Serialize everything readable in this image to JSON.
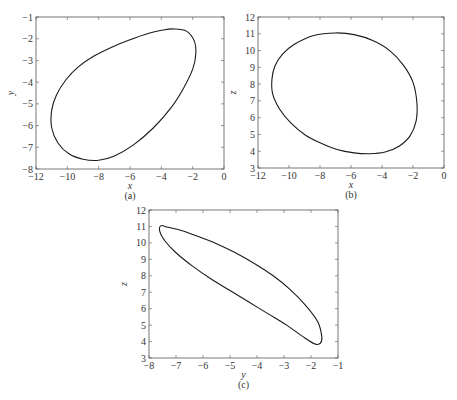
{
  "chart_data": [
    {
      "id": "a",
      "type": "line",
      "caption": "(a)",
      "xlabel": "x",
      "ylabel": "y",
      "xlim": [
        -12,
        0
      ],
      "ylim": [
        -8,
        -1
      ],
      "xticks": [
        -12,
        -10,
        -8,
        -6,
        -4,
        -2,
        0
      ],
      "yticks": [
        -8,
        -7,
        -6,
        -5,
        -4,
        -3,
        -2,
        -1
      ],
      "grid": false,
      "series": [
        {
          "name": "trajectory x-y",
          "closed": true,
          "x": [
            -3.2,
            -2.4,
            -1.9,
            -1.8,
            -2.0,
            -2.6,
            -3.4,
            -4.5,
            -5.8,
            -7.0,
            -8.0,
            -9.0,
            -9.9,
            -10.6,
            -11.0,
            -11.0,
            -10.7,
            -10.1,
            -9.3,
            -8.3,
            -7.2,
            -6.0,
            -4.8,
            -3.9
          ],
          "y": [
            -1.55,
            -1.65,
            -2.1,
            -2.7,
            -3.4,
            -4.3,
            -5.2,
            -6.1,
            -6.9,
            -7.4,
            -7.6,
            -7.55,
            -7.3,
            -6.8,
            -6.1,
            -5.3,
            -4.6,
            -3.9,
            -3.3,
            -2.8,
            -2.4,
            -2.05,
            -1.75,
            -1.6
          ]
        }
      ]
    },
    {
      "id": "b",
      "type": "line",
      "caption": "(b)",
      "xlabel": "x",
      "ylabel": "z",
      "xlim": [
        -12,
        0
      ],
      "ylim": [
        3,
        12
      ],
      "xticks": [
        -12,
        -10,
        -8,
        -6,
        -4,
        -2,
        0
      ],
      "yticks": [
        3,
        4,
        5,
        6,
        7,
        8,
        9,
        10,
        11,
        12
      ],
      "grid": false,
      "series": [
        {
          "name": "trajectory x-z",
          "closed": true,
          "x": [
            -7.0,
            -5.8,
            -4.6,
            -3.5,
            -2.6,
            -2.0,
            -1.75,
            -1.8,
            -2.2,
            -2.9,
            -3.8,
            -4.8,
            -5.8,
            -6.9,
            -8.0,
            -9.0,
            -9.9,
            -10.6,
            -11.05,
            -11.1,
            -10.9,
            -10.4,
            -9.6,
            -8.4
          ],
          "y": [
            11.05,
            10.95,
            10.6,
            10.0,
            9.1,
            8.1,
            6.9,
            5.8,
            4.9,
            4.3,
            3.95,
            3.85,
            3.9,
            4.1,
            4.5,
            5.0,
            5.7,
            6.5,
            7.4,
            8.3,
            9.1,
            9.8,
            10.4,
            10.9
          ]
        }
      ]
    },
    {
      "id": "c",
      "type": "line",
      "caption": "(c)",
      "xlabel": "y",
      "ylabel": "z",
      "xlim": [
        -8,
        -1
      ],
      "ylim": [
        3,
        12
      ],
      "xticks": [
        -8,
        -7,
        -6,
        -5,
        -4,
        -3,
        -2,
        -1
      ],
      "yticks": [
        3,
        4,
        5,
        6,
        7,
        8,
        9,
        10,
        11,
        12
      ],
      "grid": false,
      "series": [
        {
          "name": "trajectory y-z",
          "closed": true,
          "x": [
            -7.55,
            -7.3,
            -6.8,
            -6.2,
            -5.5,
            -4.8,
            -4.1,
            -3.4,
            -2.8,
            -2.2,
            -1.75,
            -1.6,
            -1.65,
            -1.85,
            -2.3,
            -2.9,
            -3.6,
            -4.3,
            -5.0,
            -5.7,
            -6.4,
            -7.0,
            -7.4,
            -7.6
          ],
          "y": [
            11.05,
            10.95,
            10.75,
            10.4,
            9.95,
            9.4,
            8.75,
            8.0,
            7.2,
            6.2,
            5.2,
            4.3,
            3.9,
            3.85,
            4.3,
            5.0,
            5.7,
            6.4,
            7.1,
            7.8,
            8.6,
            9.4,
            10.1,
            10.7
          ]
        }
      ]
    }
  ],
  "layout": {
    "line_color": "#1a1a1a",
    "axis_color": "#555555",
    "panels": {
      "a": {
        "left": 36,
        "top": 17,
        "right": 224,
        "bottom": 169
      },
      "b": {
        "left": 258,
        "top": 17,
        "right": 444,
        "bottom": 168
      },
      "c": {
        "left": 149,
        "top": 210,
        "right": 338,
        "bottom": 358
      }
    }
  }
}
